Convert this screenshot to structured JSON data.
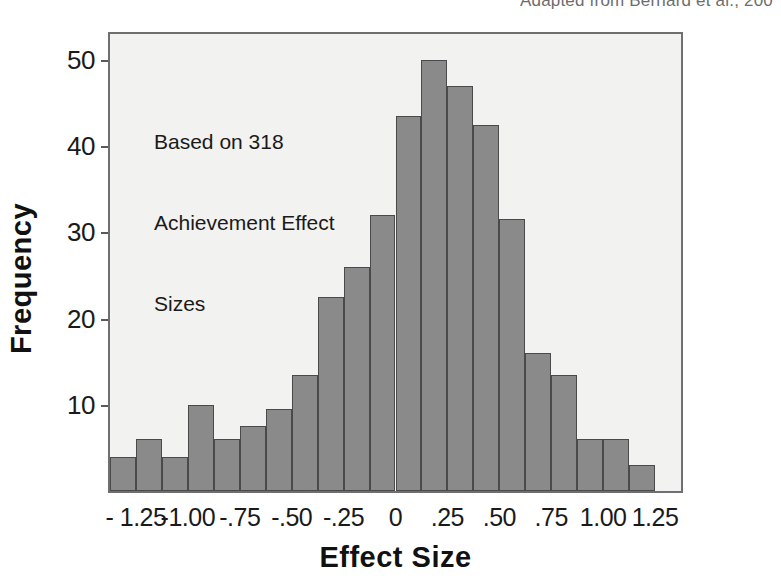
{
  "credit": {
    "text": "Adapted from Bernard et al., 200"
  },
  "annotation": {
    "line1": "Based on 318",
    "line2": "Achievement Effect",
    "line3": "Sizes"
  },
  "axis_titles": {
    "x": "Effect Size",
    "y": "Frequency"
  },
  "colors": {
    "bar_fill": "#8a8a8a",
    "bar_stroke": "#4a4a4a",
    "plot_background": "#f2f2f0",
    "frame": "#6f6f6f",
    "text": "#1a1a1a",
    "credit_text": "#6d6d6d"
  },
  "chart_data": {
    "type": "bar",
    "title": "",
    "subtitle": "",
    "xlabel": "Effect Size",
    "ylabel": "Frequency",
    "grid": false,
    "legend": "none",
    "annotations": [
      "Based on 318",
      "Achievement Effect",
      "Sizes"
    ],
    "ylim": [
      0,
      53
    ],
    "yticks": [
      10,
      20,
      30,
      40,
      50
    ],
    "ytick_labels": [
      "10",
      "20",
      "30",
      "40",
      "50"
    ],
    "xlim": [
      -1.375,
      1.375
    ],
    "xticks": [
      -1.25,
      -1.0,
      -0.75,
      -0.5,
      -0.25,
      0,
      0.25,
      0.5,
      0.75,
      1.0,
      1.25
    ],
    "xtick_labels": [
      "- 1.25",
      "-1.00",
      "-.75",
      "-.50",
      "-.25",
      "0",
      ".25",
      ".50",
      ".75",
      "1.00",
      "1.25"
    ],
    "bin_width": 0.125,
    "bin_centers": [
      -1.3125,
      -1.1875,
      -1.0625,
      -0.9375,
      -0.8125,
      -0.6875,
      -0.5625,
      -0.4375,
      -0.3125,
      -0.1875,
      -0.0625,
      0.0625,
      0.1875,
      0.3125,
      0.4375,
      0.5625,
      0.6875,
      0.8125,
      0.9375,
      1.0625,
      1.1875,
      1.3125
    ],
    "categories": [
      "-1.3125",
      "-1.1875",
      "-1.0625",
      "-0.9375",
      "-0.8125",
      "-0.6875",
      "-0.5625",
      "-0.4375",
      "-0.3125",
      "-0.1875",
      "-0.0625",
      "0.0625",
      "0.1875",
      "0.3125",
      "0.4375",
      "0.5625",
      "0.6875",
      "0.8125",
      "0.9375",
      "1.0625",
      "1.1875",
      "1.3125"
    ],
    "values": [
      4,
      6,
      4,
      10,
      6,
      7.5,
      9.5,
      13.5,
      22.5,
      26,
      32,
      43.5,
      50,
      47,
      42.5,
      31.5,
      16,
      13.5,
      6,
      6,
      3,
      0
    ],
    "total_effect_sizes": 318
  }
}
